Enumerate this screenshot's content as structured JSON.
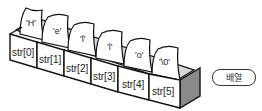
{
  "diagram": {
    "array_name": "str",
    "cells": [
      {
        "index_label": "str[0]",
        "value": "'H'"
      },
      {
        "index_label": "str[1]",
        "value": "'e'"
      },
      {
        "index_label": "str[2]",
        "value": "'l'"
      },
      {
        "index_label": "str[3]",
        "value": "'l'"
      },
      {
        "index_label": "str[4]",
        "value": "'o'"
      },
      {
        "index_label": "str[5]",
        "value": "'\\0'"
      }
    ],
    "legend_label": "배열",
    "colors": {
      "stroke": "#111111",
      "face": "#ffffff",
      "shade": "#cfcfcf",
      "side": "#8a8a8a"
    }
  }
}
